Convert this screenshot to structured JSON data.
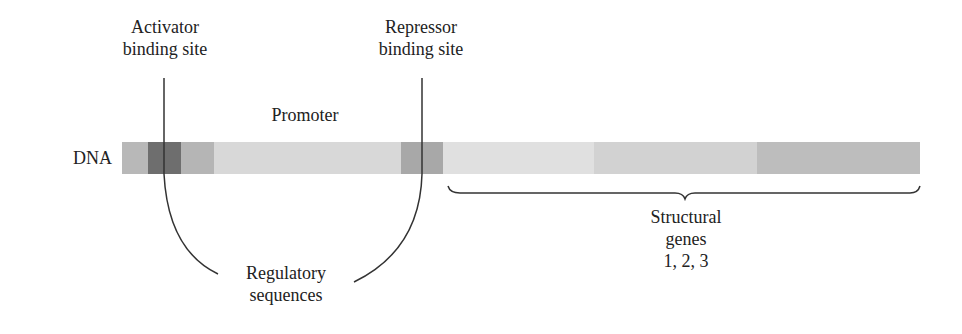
{
  "labels": {
    "activator_line1": "Activator",
    "activator_line2": "binding site",
    "repressor_line1": "Repressor",
    "repressor_line2": "binding site",
    "promoter": "Promoter",
    "dna": "DNA",
    "regulatory_line1": "Regulatory",
    "regulatory_line2": "sequences",
    "structural_line1": "Structural",
    "structural_line2": "genes",
    "structural_line3": "1, 2, 3"
  },
  "dna_segments": [
    {
      "name": "upstream",
      "x": 122,
      "width": 26,
      "color": "#b8b8b8"
    },
    {
      "name": "activator-site",
      "x": 148,
      "width": 33,
      "color": "#6e6e6e"
    },
    {
      "name": "regulatory-flank",
      "x": 181,
      "width": 33,
      "color": "#b5b5b5"
    },
    {
      "name": "promoter",
      "x": 214,
      "width": 187,
      "color": "#d8d8d8"
    },
    {
      "name": "repressor-site",
      "x": 401,
      "width": 42,
      "color": "#a8a8a8"
    },
    {
      "name": "gene-1",
      "x": 443,
      "width": 151,
      "color": "#e0e0e0"
    },
    {
      "name": "gene-2",
      "x": 594,
      "width": 163,
      "color": "#d2d2d2"
    },
    {
      "name": "gene-3",
      "x": 757,
      "width": 163,
      "color": "#bdbdbd"
    }
  ],
  "colors": {
    "line": "#333333",
    "text": "#222222"
  }
}
